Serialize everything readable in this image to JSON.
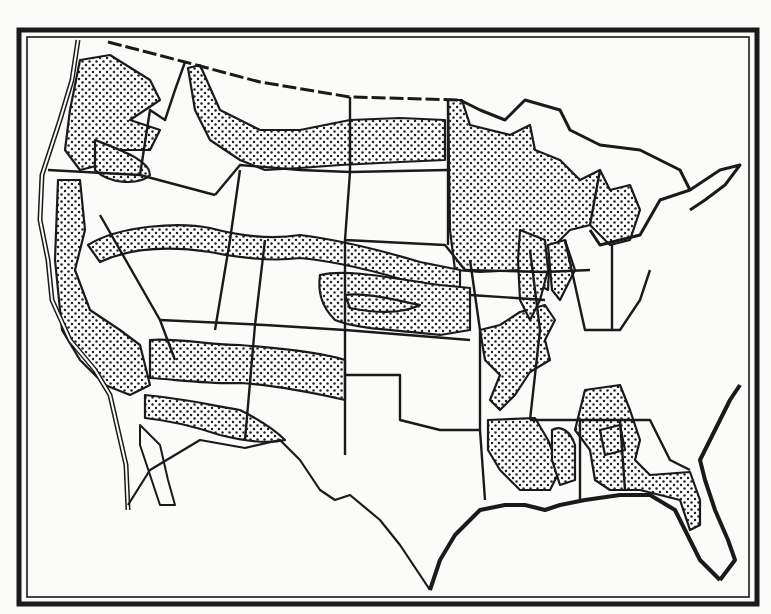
{
  "map": {
    "subject": "United States outline map with stippled bands",
    "colors": {
      "paper": "#fbfbf9",
      "ink": "#1a1a1a",
      "stipple_fill": "#ffffff",
      "stipple_dot": "#222222"
    },
    "frame": {
      "style": "double-line border",
      "outer_weight": "thick",
      "inner_weight": "thin"
    },
    "boundaries": {
      "international": "dashed",
      "states": "solid and dashed",
      "coast": "triple-line"
    },
    "bands": [
      {
        "name": "pacific-northwest-band"
      },
      {
        "name": "northern-plains-band"
      },
      {
        "name": "great-lakes-region-band"
      },
      {
        "name": "pacific-coast-band"
      },
      {
        "name": "central-belt-band"
      },
      {
        "name": "southwest-belt-band"
      },
      {
        "name": "mississippi-valley-band"
      },
      {
        "name": "gulf-southeast-band"
      }
    ]
  }
}
